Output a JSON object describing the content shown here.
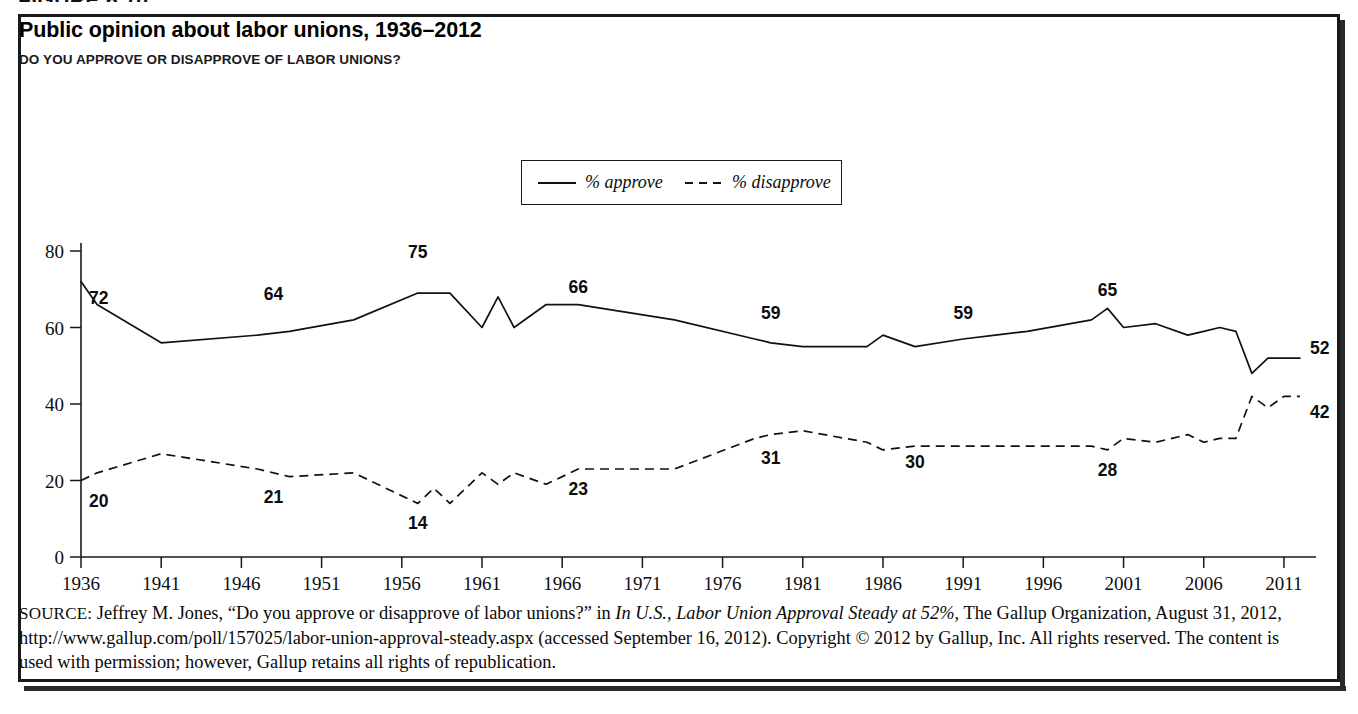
{
  "figure": {
    "number_label": "FIGURE 6.10"
  },
  "chart_title": "Public opinion about labor unions, 1936–2012",
  "chart_subtitle": "DO YOU APPROVE OR DISAPPROVE OF LABOR UNIONS?",
  "legend": {
    "approve_label": "% approve",
    "disapprove_label": "% disapprove"
  },
  "source": {
    "label": "SOURCE:",
    "text_1": " Jeffrey M. Jones, “Do you approve or disapprove of labor unions?” in ",
    "italic_1": "In U.S., Labor Union Approval Steady at 52%",
    "text_2": ", The Gallup Organization, August 31, 2012, http://www.gallup.com/poll/157025/labor-union-approval-steady.aspx (accessed September 16, 2012). Copyright © 2012 by Gallup, Inc. All rights reserved. The content is used with permission; however, Gallup retains all rights of republication."
  },
  "chart_data": {
    "type": "line",
    "title": "Public opinion about labor unions, 1936–2012",
    "subtitle": "DO YOU APPROVE OR DISAPPROVE OF LABOR UNIONS?",
    "xlabel": "",
    "ylabel": "",
    "xlim": [
      1936,
      2012
    ],
    "ylim": [
      0,
      80
    ],
    "ytick_values": [
      0,
      20,
      40,
      60,
      80
    ],
    "ytick_labels": [
      "0",
      "20",
      "40",
      "60",
      "80"
    ],
    "xtick_values": [
      1936,
      1941,
      1946,
      1951,
      1956,
      1961,
      1966,
      1971,
      1976,
      1981,
      1986,
      1991,
      1996,
      2001,
      2006,
      2011
    ],
    "xtick_labels": [
      "1936",
      "1941",
      "1946",
      "1951",
      "1956",
      "1961",
      "1966",
      "1971",
      "1976",
      "1981",
      "1986",
      "1991",
      "1996",
      "2001",
      "2006",
      "2011"
    ],
    "grid": false,
    "legend_position": "top-center",
    "series": [
      {
        "name": "% approve",
        "style": "solid",
        "x": [
          1936,
          1937,
          1941,
          1947,
          1949,
          1953,
          1957,
          1958,
          1959,
          1961,
          1962,
          1963,
          1965,
          1967,
          1973,
          1978,
          1979,
          1981,
          1985,
          1986,
          1988,
          1991,
          1993,
          1995,
          1999,
          2000,
          2001,
          2003,
          2005,
          2006,
          2007,
          2008,
          2009,
          2010,
          2011,
          2012
        ],
        "y": [
          72,
          66,
          56,
          58,
          59,
          62,
          69,
          69,
          69,
          60,
          68,
          60,
          66,
          66,
          62,
          57,
          56,
          55,
          55,
          58,
          55,
          57,
          58,
          59,
          62,
          65,
          60,
          61,
          58,
          59,
          60,
          59,
          48,
          52,
          52,
          52
        ]
      },
      {
        "name": "% disapprove",
        "style": "dashed",
        "x": [
          1936,
          1937,
          1941,
          1947,
          1949,
          1953,
          1957,
          1958,
          1959,
          1961,
          1962,
          1963,
          1965,
          1967,
          1973,
          1978,
          1979,
          1981,
          1985,
          1986,
          1988,
          1991,
          1993,
          1995,
          1999,
          2000,
          2001,
          2003,
          2005,
          2006,
          2007,
          2008,
          2009,
          2010,
          2011,
          2012
        ],
        "y": [
          20,
          22,
          27,
          23,
          21,
          22,
          14,
          18,
          14,
          22,
          19,
          22,
          19,
          23,
          23,
          31,
          32,
          33,
          30,
          28,
          29,
          29,
          29,
          29,
          29,
          28,
          31,
          30,
          32,
          30,
          31,
          31,
          42,
          39,
          42,
          42
        ]
      }
    ],
    "point_labels": [
      {
        "series": "% approve",
        "year": 1936,
        "value": 72,
        "text": "72"
      },
      {
        "series": "% approve",
        "year": 1948,
        "value": 64,
        "text": "64"
      },
      {
        "series": "% approve",
        "year": 1957,
        "value": 75,
        "text": "75"
      },
      {
        "series": "% approve",
        "year": 1967,
        "value": 66,
        "text": "66"
      },
      {
        "series": "% approve",
        "year": 1979,
        "value": 59,
        "text": "59"
      },
      {
        "series": "% approve",
        "year": 1991,
        "value": 59,
        "text": "59"
      },
      {
        "series": "% approve",
        "year": 2000,
        "value": 65,
        "text": "65"
      },
      {
        "series": "% approve",
        "year": 2012,
        "value": 52,
        "text": "52"
      },
      {
        "series": "% disapprove",
        "year": 1936,
        "value": 20,
        "text": "20"
      },
      {
        "series": "% disapprove",
        "year": 1948,
        "value": 21,
        "text": "21"
      },
      {
        "series": "% disapprove",
        "year": 1957,
        "value": 14,
        "text": "14"
      },
      {
        "series": "% disapprove",
        "year": 1967,
        "value": 23,
        "text": "23"
      },
      {
        "series": "% disapprove",
        "year": 1979,
        "value": 31,
        "text": "31"
      },
      {
        "series": "% disapprove",
        "year": 1988,
        "value": 30,
        "text": "30"
      },
      {
        "series": "% disapprove",
        "year": 2000,
        "value": 28,
        "text": "28"
      },
      {
        "series": "% disapprove",
        "year": 2012,
        "value": 42,
        "text": "42"
      }
    ]
  }
}
